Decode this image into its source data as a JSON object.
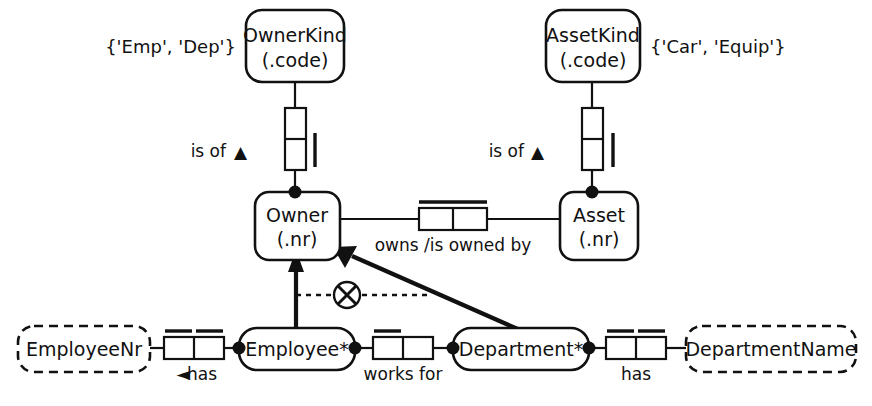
{
  "diagram": {
    "stroke_color": "#111111",
    "background_color": "#ffffff"
  },
  "objects": {
    "owner_kind": {
      "name": "OwnerKind",
      "ref": "(.code)"
    },
    "asset_kind": {
      "name": "AssetKind",
      "ref": "(.code)"
    },
    "owner": {
      "name": "Owner",
      "ref": "(.nr)"
    },
    "asset": {
      "name": "Asset",
      "ref": "(.nr)"
    },
    "employee": {
      "name": "Employee*"
    },
    "department": {
      "name": "Department*"
    },
    "employee_nr": {
      "name": "EmployeeNr"
    },
    "department_name": {
      "name": "DepartmentName"
    }
  },
  "value_constraints": {
    "owner_kind_values": "{'Emp', 'Dep'}",
    "asset_kind_values": "{'Car', 'Equip'}"
  },
  "predicates": {
    "owner_is_of_kind": "is of",
    "asset_is_of_kind": "is of",
    "owns": "owns /is owned by",
    "employee_has_nr": "has",
    "works_for": "works for",
    "department_has_name": "has"
  },
  "markers": {
    "owner_is_of_arrow": "▲",
    "asset_is_of_arrow": "▲",
    "employee_has_arrow": "◄",
    "exclusion_constraint": "exclusive-or-circle-x"
  }
}
